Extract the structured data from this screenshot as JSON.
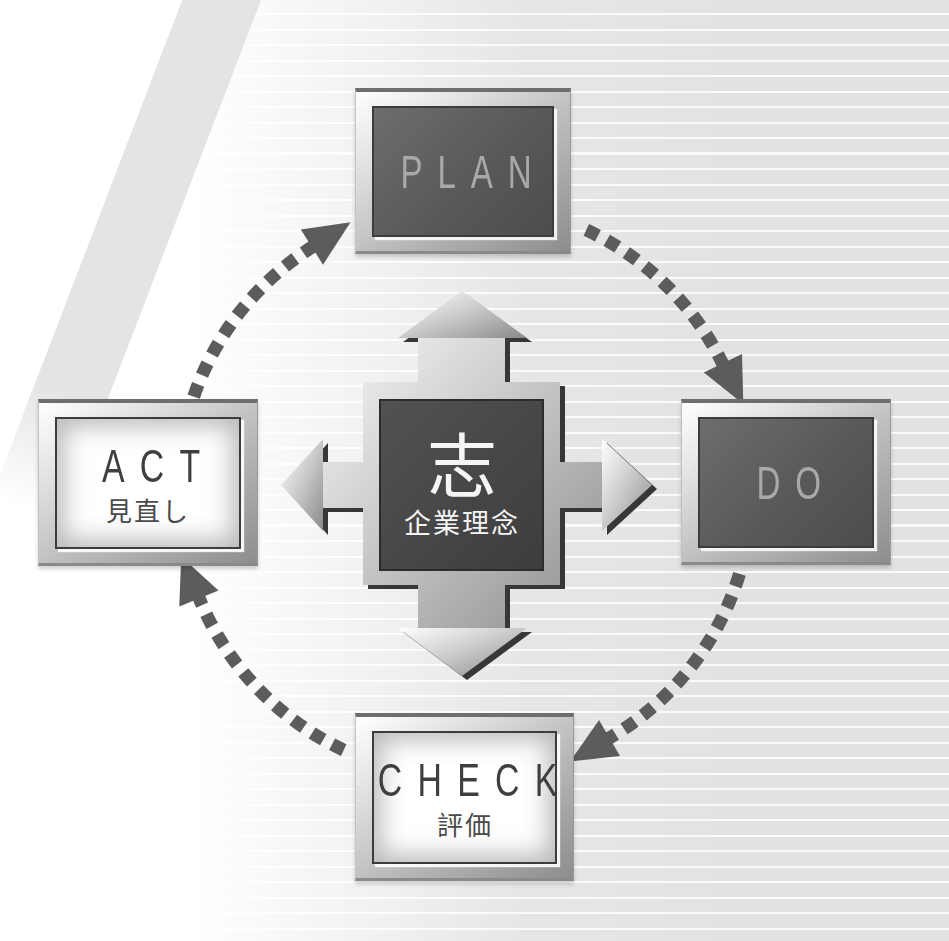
{
  "diagram_type": "pdca-cycle",
  "center": {
    "main_label": "志",
    "sub_label": "企業理念"
  },
  "nodes": [
    {
      "id": "plan",
      "label": "PLAN",
      "sublabel": "",
      "variant": "dark"
    },
    {
      "id": "do",
      "label": "DO",
      "sublabel": "",
      "variant": "dark"
    },
    {
      "id": "check",
      "label": "CHECK",
      "sublabel": "評価",
      "variant": "light"
    },
    {
      "id": "act",
      "label": "ACT",
      "sublabel": "見直し",
      "variant": "light"
    }
  ],
  "cycle": {
    "sequence": [
      "PLAN",
      "DO",
      "CHECK",
      "ACT"
    ],
    "direction": "clockwise"
  },
  "colors": {
    "background": "#ffffff",
    "background_stripe": "#e2e2e2",
    "stripe_highlight": "#fafafa",
    "diagonal_band": "#e4e4e4",
    "dash_arrow": "#5c5c5c",
    "frame_silver_light": "#f5f5f5",
    "frame_silver_dark": "#8d8d8d",
    "frame_top_edge": "#6e6e6e",
    "panel_dark": "#595959",
    "panel_light": "#ffffff",
    "center_square": "#464646",
    "text_on_dark": "#a9a9a9",
    "text_on_light": "#3f3f3f",
    "text_center": "#f5f5f5"
  }
}
